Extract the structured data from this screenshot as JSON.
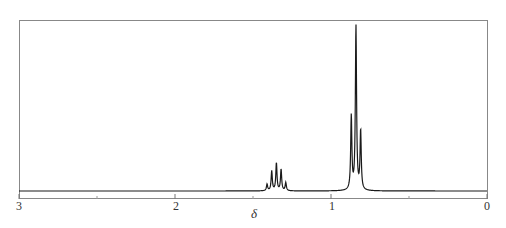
{
  "chart_data": {
    "type": "line",
    "title": "",
    "subtitle": "",
    "xlabel": "δ",
    "ylabel": "",
    "x_reversed": true,
    "xlim": [
      3,
      0
    ],
    "xticks": [
      {
        "value": 3,
        "label": "3"
      },
      {
        "value": 2,
        "label": "2"
      },
      {
        "value": 1,
        "label": "1"
      },
      {
        "value": 0,
        "label": "0"
      }
    ],
    "minor_xticks": [
      2.5,
      1.5,
      0.5
    ],
    "grid": false,
    "legend": null,
    "series": [
      {
        "name": "1H NMR spectrum",
        "multiplets": [
          {
            "name": "multiplet ~1.35 ppm",
            "center_ppm": 1.35,
            "lines": [
              {
                "ppm": 1.41,
                "relative_height": 0.04
              },
              {
                "ppm": 1.38,
                "relative_height": 0.12
              },
              {
                "ppm": 1.35,
                "relative_height": 0.17
              },
              {
                "ppm": 1.32,
                "relative_height": 0.13
              },
              {
                "ppm": 1.29,
                "relative_height": 0.05
              }
            ]
          },
          {
            "name": "triplet ~0.84 ppm",
            "center_ppm": 0.84,
            "lines": [
              {
                "ppm": 0.87,
                "relative_height": 0.45
              },
              {
                "ppm": 0.84,
                "relative_height": 1.0
              },
              {
                "ppm": 0.81,
                "relative_height": 0.36
              }
            ]
          }
        ]
      }
    ]
  },
  "axis": {
    "labels": [
      "3",
      "2",
      "1",
      "0"
    ],
    "title": "δ"
  },
  "colors": {
    "trace": "#1a1a1a",
    "frame": "#777777",
    "text": "#333333"
  }
}
